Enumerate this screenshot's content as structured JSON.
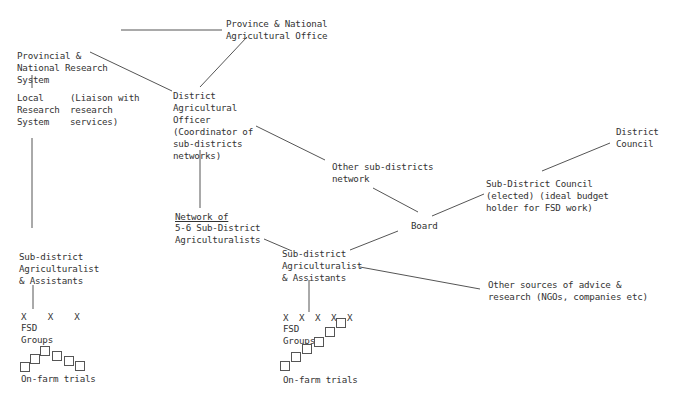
{
  "diagram": {
    "nodes": {
      "province_office": "Province & National\nAgricultural Office",
      "provincial_research": "Provincial &\nNational Research\nSystem",
      "local_research": "Local\nResearch\nSystem",
      "liaison_note": "(Liaison with\nresearch\nservices)",
      "district_officer": "District\nAgricultural\nOfficer\n(Coordinator of\nsub-districts\nnetworks)",
      "other_networks": "Other sub-districts\nnetwork",
      "district_council": "District\nCouncil",
      "subdistrict_council": "Sub-District Council\n(elected) (ideal budget\nholder for FSD work)",
      "network_title": "Network of",
      "network_rest": "5-6 Sub-District\nAgriculturalists",
      "board": "Board",
      "left_agriculturalist": "Sub-district\nAgriculturalist\n& Assistants",
      "center_agriculturalist": "Sub-district\nAgriculturalist\n& Assistants",
      "other_sources": "Other sources of advice &\nresearch (NGOs, companies etc)",
      "left_groups_marks": "X    X    X",
      "left_groups_label": "FSD\nGroups",
      "left_trials": "On-farm trials",
      "center_groups_marks": "X  X  X  X  X",
      "center_groups_label": "FSD\nGroups",
      "center_trials": "On-farm trials"
    }
  }
}
